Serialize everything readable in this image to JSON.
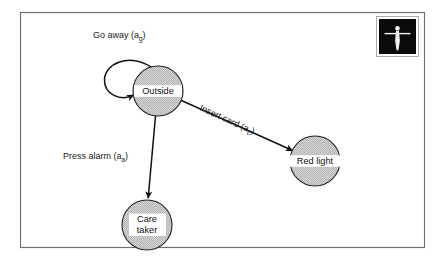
{
  "figure": {
    "kind": "state-transition-diagram",
    "title": "",
    "frame": {
      "color": "#6e6e6e"
    },
    "palette": {
      "node_fill": "#c9c9c9",
      "node_stroke": "#222222",
      "edge_color": "#111111",
      "text_color": "#1a1a1a",
      "badge_bg": "#0a0a0a",
      "badge_figure": "#f2f2f2",
      "page_bg": "#ffffff"
    }
  },
  "badge": {
    "name": "person-figure-icon",
    "description": "standing human figure with outstretched arms"
  },
  "nodes": [
    {
      "id": "outside",
      "label": "Outside",
      "label_lines": [
        "Outside"
      ],
      "cx": 158,
      "cy": 91,
      "r": 25
    },
    {
      "id": "red_light",
      "label": "Red light",
      "label_lines": [
        "Red light"
      ],
      "cx": 315,
      "cy": 161,
      "r": 25
    },
    {
      "id": "care_taker",
      "label": "Care taker",
      "label_lines": [
        "Care",
        "taker"
      ],
      "cx": 147,
      "cy": 225,
      "r": 25
    }
  ],
  "edges": [
    {
      "id": "go_away",
      "from": "outside",
      "to": "outside",
      "kind": "self-loop",
      "label_main": "Go away (a",
      "label_sub": "g",
      "label_tail": ")",
      "label_full": "Go away (a_g)"
    },
    {
      "id": "insert_card",
      "from": "outside",
      "to": "red_light",
      "kind": "straight",
      "label_main": "Insert card (a",
      "label_sub": "c",
      "label_tail": ")",
      "label_full": "Insert card (a_c)"
    },
    {
      "id": "press_alarm",
      "from": "outside",
      "to": "care_taker",
      "kind": "straight",
      "label_main": "Press alarm (a",
      "label_sub": "a",
      "label_tail": ")",
      "label_full": "Press alarm (a_a)"
    }
  ]
}
